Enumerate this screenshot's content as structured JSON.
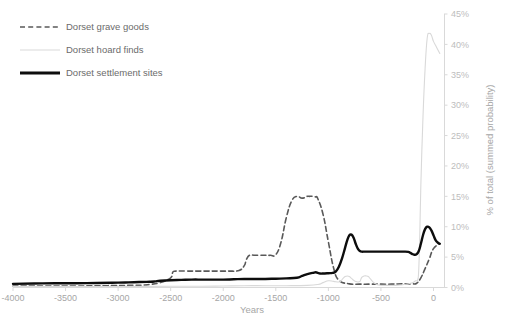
{
  "chart_data": {
    "type": "line",
    "title": "",
    "xlabel": "Years",
    "ylabel": "% of total (summed probability)",
    "xlim": [
      -4000,
      100
    ],
    "ylim": [
      0,
      45
    ],
    "grid": false,
    "legend_position": "top-left",
    "y_axis_side": "right",
    "x_ticks": [
      "-4000",
      "-3500",
      "-3000",
      "-2500",
      "-2000",
      "-1500",
      "-1000",
      "-500",
      "0"
    ],
    "x_tick_values": [
      -4000,
      -3500,
      -3000,
      -2500,
      -2000,
      -1500,
      -1000,
      -500,
      0
    ],
    "y_ticks": [
      "0%",
      "5%",
      "10%",
      "15%",
      "20%",
      "25%",
      "30%",
      "35%",
      "40%",
      "45%"
    ],
    "y_tick_values": [
      0,
      5,
      10,
      15,
      20,
      25,
      30,
      35,
      40,
      45
    ],
    "series": [
      {
        "name": "Dorset grave goods",
        "style": "dashed",
        "color": "#595959",
        "width": 1.6,
        "x": [
          -4000,
          -3700,
          -3400,
          -3100,
          -2900,
          -2750,
          -2700,
          -2600,
          -2500,
          -2480,
          -2450,
          -2350,
          -2250,
          -2150,
          -2050,
          -1950,
          -1850,
          -1800,
          -1780,
          -1750,
          -1700,
          -1650,
          -1600,
          -1550,
          -1500,
          -1450,
          -1400,
          -1350,
          -1300,
          -1250,
          -1200,
          -1180,
          -1150,
          -1120,
          -1100,
          -1050,
          -1000,
          -950,
          -900,
          -800,
          -700,
          -600,
          -500,
          -400,
          -300,
          -250,
          -200,
          -160,
          -120,
          -80,
          -40,
          0,
          60
        ],
        "y": [
          0.25,
          0.25,
          0.25,
          0.3,
          0.35,
          0.4,
          0.5,
          0.8,
          1.6,
          2.5,
          2.7,
          2.7,
          2.7,
          2.7,
          2.7,
          2.7,
          2.8,
          3.6,
          4.6,
          5.3,
          5.3,
          5.3,
          5.3,
          5.3,
          5.4,
          7.5,
          11.5,
          14.2,
          15.0,
          14.7,
          15.0,
          15.0,
          15.0,
          14.9,
          14.6,
          12.0,
          7.5,
          3.2,
          1.2,
          0.6,
          0.55,
          0.55,
          0.55,
          0.55,
          0.6,
          0.6,
          0.6,
          0.7,
          1.6,
          3.1,
          4.7,
          6.4,
          7.2
        ]
      },
      {
        "name": "Dorset hoard finds",
        "style": "solid",
        "color": "#d9d9d9",
        "width": 1.1,
        "x": [
          -4000,
          -3500,
          -3000,
          -2500,
          -2200,
          -2000,
          -1800,
          -1600,
          -1400,
          -1200,
          -1100,
          -1050,
          -1000,
          -950,
          -900,
          -880,
          -860,
          -840,
          -820,
          -800,
          -780,
          -760,
          -740,
          -720,
          -700,
          -690,
          -680,
          -660,
          -640,
          -620,
          -600,
          -560,
          -520,
          -480,
          -440,
          -400,
          -360,
          -320,
          -280,
          -240,
          -200,
          -170,
          -150,
          -140,
          -130,
          -120,
          -100,
          -80,
          -60,
          -40,
          -20,
          0,
          30,
          60
        ],
        "y": [
          0.15,
          0.15,
          0.15,
          0.2,
          0.2,
          0.25,
          0.3,
          0.3,
          0.3,
          0.35,
          0.5,
          0.8,
          1.1,
          1.0,
          0.9,
          1.1,
          1.5,
          1.8,
          1.9,
          1.8,
          1.5,
          1.2,
          1.0,
          0.9,
          1.0,
          1.4,
          1.7,
          1.9,
          1.9,
          1.8,
          1.4,
          0.7,
          0.4,
          0.35,
          0.35,
          0.35,
          0.35,
          0.4,
          0.5,
          0.6,
          0.8,
          1.1,
          1.3,
          3.0,
          9.0,
          17.0,
          28.0,
          36.0,
          41.0,
          41.8,
          41.5,
          40.5,
          39.5,
          38.5
        ]
      },
      {
        "name": "Dorset settlement sites",
        "style": "solid",
        "color": "#0d0d0d",
        "width": 2.4,
        "x": [
          -4000,
          -3800,
          -3600,
          -3400,
          -3200,
          -3000,
          -2900,
          -2800,
          -2700,
          -2650,
          -2600,
          -2500,
          -2400,
          -2300,
          -2200,
          -2100,
          -2000,
          -1900,
          -1800,
          -1700,
          -1600,
          -1500,
          -1400,
          -1300,
          -1250,
          -1200,
          -1150,
          -1120,
          -1100,
          -1080,
          -1050,
          -1000,
          -960,
          -930,
          -900,
          -870,
          -840,
          -820,
          -800,
          -780,
          -760,
          -740,
          -720,
          -700,
          -680,
          -660,
          -640,
          -600,
          -560,
          -520,
          -480,
          -440,
          -400,
          -360,
          -320,
          -280,
          -240,
          -220,
          -200,
          -180,
          -160,
          -140,
          -120,
          -100,
          -80,
          -60,
          -40,
          -20,
          0,
          20,
          40,
          60
        ],
        "y": [
          0.6,
          0.65,
          0.7,
          0.7,
          0.75,
          0.8,
          0.85,
          0.9,
          0.95,
          1.0,
          1.1,
          1.2,
          1.25,
          1.3,
          1.3,
          1.3,
          1.3,
          1.35,
          1.4,
          1.4,
          1.4,
          1.45,
          1.5,
          1.6,
          1.9,
          2.2,
          2.4,
          2.5,
          2.4,
          2.3,
          2.3,
          2.35,
          2.4,
          2.6,
          3.4,
          4.8,
          6.6,
          7.8,
          8.6,
          8.7,
          8.2,
          7.2,
          6.4,
          6.0,
          5.9,
          5.9,
          5.9,
          5.9,
          5.9,
          5.9,
          5.9,
          5.9,
          5.9,
          5.9,
          5.9,
          5.9,
          5.85,
          5.7,
          5.5,
          5.4,
          5.5,
          6.0,
          7.2,
          8.6,
          9.6,
          10.0,
          9.9,
          9.4,
          8.6,
          7.8,
          7.4,
          7.2
        ]
      }
    ]
  },
  "legend": {
    "items": [
      {
        "label": "Dorset grave goods",
        "marker": "dashed-line-marker"
      },
      {
        "label": "Dorset hoard finds",
        "marker": "thin-line-marker"
      },
      {
        "label": "Dorset settlement sites",
        "marker": "thick-line-marker"
      }
    ]
  },
  "colors": {
    "grave_goods": "#595959",
    "hoard_finds": "#d9d9d9",
    "settlement_sites": "#0d0d0d",
    "axis": "#d9d9d9",
    "tick_label": "#a6a6a6",
    "legend_label": "#6b6b6b",
    "background": "#ffffff"
  }
}
